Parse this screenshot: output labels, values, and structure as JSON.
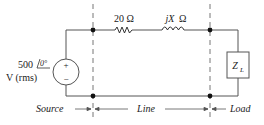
{
  "diagram": {
    "type": "circuit",
    "source": {
      "magnitude": "500",
      "angle": "0°",
      "unit": "V (rms)",
      "plus": "+",
      "minus": "−"
    },
    "line": {
      "resistor_label": "20 Ω",
      "reactance_prefix": "jX",
      "reactance_unit": "Ω"
    },
    "load": {
      "label_main": "Z",
      "label_sub": "L"
    },
    "sections": {
      "source": "Source",
      "line": "Line",
      "load": "Load"
    },
    "colors": {
      "wire": "#555555",
      "dash": "#666666",
      "node": "#111111",
      "text": "#222222"
    }
  }
}
